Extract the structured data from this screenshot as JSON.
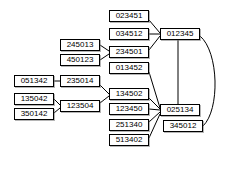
{
  "diagram": {
    "type": "graph",
    "colors": {
      "node_fill": "#ffffff",
      "node_border": "#000000",
      "edge": "#000000",
      "background": "#ffffff",
      "shadow": "#787878"
    },
    "nodes": [
      {
        "id": "n023451",
        "label": "023451",
        "x": 109,
        "y": 10,
        "w": 40
      },
      {
        "id": "n034512",
        "label": "034512",
        "x": 109,
        "y": 28,
        "w": 40
      },
      {
        "id": "n012345",
        "label": "012345",
        "x": 160,
        "y": 28,
        "w": 40
      },
      {
        "id": "n245013",
        "label": "245013",
        "x": 60,
        "y": 39,
        "w": 40
      },
      {
        "id": "n234501",
        "label": "234501",
        "x": 109,
        "y": 46,
        "w": 40
      },
      {
        "id": "n450123",
        "label": "450123",
        "x": 60,
        "y": 54,
        "w": 40
      },
      {
        "id": "n013452",
        "label": "013452",
        "x": 109,
        "y": 62,
        "w": 40
      },
      {
        "id": "n051342",
        "label": "051342",
        "x": 14,
        "y": 75,
        "w": 40
      },
      {
        "id": "n235014",
        "label": "235014",
        "x": 60,
        "y": 75,
        "w": 40
      },
      {
        "id": "n134502",
        "label": "134502",
        "x": 109,
        "y": 88,
        "w": 40
      },
      {
        "id": "n135042",
        "label": "135042",
        "x": 14,
        "y": 93,
        "w": 40
      },
      {
        "id": "n123504",
        "label": "123504",
        "x": 60,
        "y": 100,
        "w": 40
      },
      {
        "id": "n123450",
        "label": "123450",
        "x": 109,
        "y": 103,
        "w": 40
      },
      {
        "id": "n025134",
        "label": "025134",
        "x": 160,
        "y": 104,
        "w": 40
      },
      {
        "id": "n350142",
        "label": "350142",
        "x": 14,
        "y": 108,
        "w": 40
      },
      {
        "id": "n251340",
        "label": "251340",
        "x": 109,
        "y": 119,
        "w": 40
      },
      {
        "id": "n345012",
        "label": "345012",
        "x": 163,
        "y": 120,
        "w": 40
      },
      {
        "id": "n513402",
        "label": "513402",
        "x": 109,
        "y": 134,
        "w": 40
      }
    ],
    "edges": [
      {
        "from": "n023451",
        "to": "n012345",
        "path": "M149,20 L160,33"
      },
      {
        "from": "n034512",
        "to": "n012345",
        "path": "M149,34 L160,34"
      },
      {
        "from": "n234501",
        "to": "n012345",
        "path": "M149,50 L160,36"
      },
      {
        "from": "n245013",
        "to": "n234501",
        "path": "M100,45 L109,51"
      },
      {
        "from": "n450123",
        "to": "n234501",
        "path": "M100,60 L109,54"
      },
      {
        "from": "n012345",
        "to": "n025134",
        "path": "M178,40 L178,104"
      },
      {
        "from": "n012345",
        "to": "n345012",
        "path": "M200,36 C219,52 220,110 203,126"
      },
      {
        "from": "n013452",
        "to": "n025134",
        "path": "M149,72 L160,108"
      },
      {
        "from": "n134502",
        "to": "n025134",
        "path": "M149,98 L160,109"
      },
      {
        "from": "n123450",
        "to": "n025134",
        "path": "M149,109 L160,110"
      },
      {
        "from": "n251340",
        "to": "n025134",
        "path": "M149,122 L160,112"
      },
      {
        "from": "n513402",
        "to": "n025134",
        "path": "M149,138 L160,114"
      },
      {
        "from": "n051342",
        "to": "n235014",
        "path": "M54,81 L60,81"
      },
      {
        "from": "n235014",
        "to": "n134502",
        "path": "M100,85 L109,94"
      },
      {
        "from": "n135042",
        "to": "n123504",
        "path": "M54,99 L60,105"
      },
      {
        "from": "n350142",
        "to": "n123504",
        "path": "M54,113 L60,108"
      },
      {
        "from": "n123504",
        "to": "n134502",
        "path": "M100,103 L109,96"
      }
    ]
  }
}
